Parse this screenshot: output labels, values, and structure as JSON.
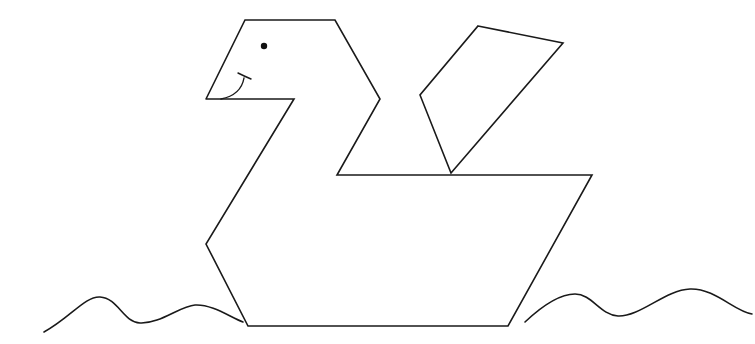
{
  "colors": {
    "line": "#1a1a1a",
    "background": "#ffffff",
    "eye": "#111111"
  },
  "figure": {
    "head": {
      "points": "206,99 245,20 335,20 380,99 337,175"
    },
    "body_outline": {
      "points": "206,99 294,99 206,244 248,326 508,326 592,175 337,175 380,99 335,20 245,20 206,99"
    },
    "wing": {
      "points": "478,26 563,43 451,173 420,95"
    },
    "eye": {
      "cx": 264,
      "cy": 46,
      "r": 3.2
    },
    "smile": {
      "d": "M221,99 Q241,95 244,78",
      "tick_d": "M238,73 Q244,76 251,79"
    },
    "waves": {
      "left_d": "M44,332 C70,318 85,296 100,297 C118,298 123,322 140,323 C160,324 180,306 195,305 C212,304 230,317 243,322",
      "right_d": "M525,322 C542,306 560,294 575,294 C592,294 600,315 618,316 C640,317 665,290 690,289 C715,288 735,312 752,314"
    }
  }
}
